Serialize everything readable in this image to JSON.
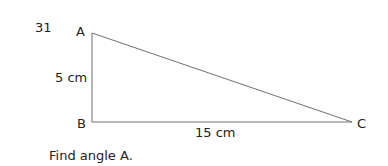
{
  "question_number": "31",
  "vertices": {
    "A": {
      "label": "A",
      "x": 92,
      "y": 33
    },
    "B": {
      "label": "B",
      "x": 92,
      "y": 122
    },
    "C": {
      "label": "C",
      "x": 352,
      "y": 122
    }
  },
  "sides": {
    "AB": "5 cm",
    "BC": "15 cm"
  },
  "prompt": "Find angle A.",
  "colors": {
    "line": "#707070",
    "text": "#222222"
  }
}
